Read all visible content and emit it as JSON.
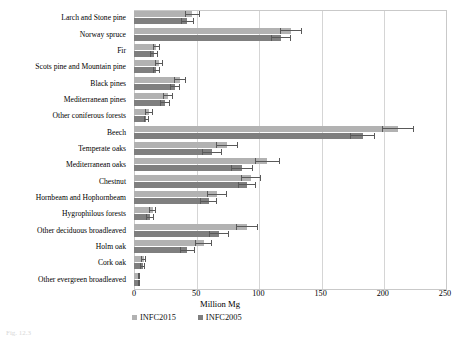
{
  "chart_data": {
    "type": "bar",
    "orientation": "horizontal",
    "title": "",
    "xlabel": "Million Mg",
    "ylabel": "",
    "xlim": [
      0,
      250
    ],
    "xticks": [
      0,
      50,
      100,
      150,
      200,
      250
    ],
    "grid": true,
    "legend_position": "bottom-left",
    "categories": [
      "Larch and Stone pine",
      "Norway spruce",
      "Fir",
      "Scots pine and Mountain pine",
      "Black pines",
      "Mediterranean pines",
      "Other coniferous forests",
      "Beech",
      "Temperate oaks",
      "Mediterranean oaks",
      "Chestnut",
      "Hornbeam and Hophornbeam",
      "Hygrophilous forests",
      "Other deciduous broadleaved",
      "Holm oak",
      "Cork oak",
      "Other evergreen broadleaved"
    ],
    "series": [
      {
        "name": "INFC2015",
        "color": "#b2b2b2",
        "values": [
          47,
          126,
          18,
          20,
          37,
          27,
          12,
          212,
          75,
          107,
          94,
          67,
          15,
          91,
          56,
          8,
          4
        ],
        "errors": [
          6,
          9,
          3,
          3,
          5,
          4,
          3,
          13,
          9,
          10,
          8,
          8,
          3,
          9,
          7,
          2,
          1
        ]
      },
      {
        "name": "INFC2005",
        "color": "#7f7f7f",
        "values": [
          43,
          118,
          16,
          18,
          33,
          25,
          10,
          184,
          63,
          87,
          91,
          60,
          13,
          68,
          43,
          7,
          4
        ],
        "errors": [
          5,
          8,
          3,
          3,
          4,
          4,
          2,
          10,
          8,
          9,
          7,
          7,
          3,
          8,
          6,
          2,
          1
        ]
      }
    ]
  },
  "legend": {
    "items": [
      {
        "label": "INFC2015"
      },
      {
        "label": "INFC2005"
      }
    ]
  },
  "axis": {
    "x_label": "Million Mg"
  },
  "caption": {
    "text": "Fig. 12.3"
  }
}
